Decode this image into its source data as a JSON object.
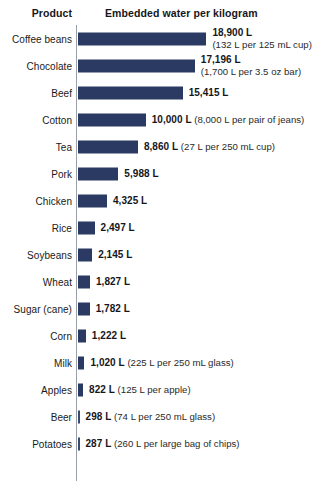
{
  "header": {
    "product_label": "Product",
    "value_label": "Embedded water per kilogram"
  },
  "colors": {
    "bar": "#2b3a63",
    "axis": "#9aa0a8",
    "background": "#ffffff",
    "text": "#16161a"
  },
  "chart_data": {
    "type": "bar",
    "title": "",
    "xlabel": "Embedded water per kilogram",
    "ylabel": "Product",
    "orientation": "horizontal",
    "unit": "L",
    "grid": false,
    "legend": null,
    "xlim": [
      0,
      18900
    ],
    "categories": [
      "Coffee beans",
      "Chocolate",
      "Beef",
      "Cotton",
      "Tea",
      "Pork",
      "Chicken",
      "Rice",
      "Soybeans",
      "Wheat",
      "Sugar (cane)",
      "Corn",
      "Milk",
      "Apples",
      "Beer",
      "Potatoes"
    ],
    "values": [
      18900,
      17196,
      15415,
      10000,
      8860,
      5988,
      4325,
      2497,
      2145,
      1827,
      1782,
      1222,
      1020,
      822,
      298,
      287
    ],
    "value_labels": [
      "18,900 L",
      "17,196 L",
      "15,415 L",
      "10,000 L",
      "8,860 L",
      "5,988 L",
      "4,325 L",
      "2,497 L",
      "2,145 L",
      "1,827 L",
      "1,782 L",
      "1,222 L",
      "1,020 L",
      "822 L",
      "298 L",
      "287 L"
    ],
    "annotations": [
      "(132 L per 125 mL cup)",
      "(1,700 L per 3.5 oz bar)",
      "",
      "(8,000 L per pair of jeans)",
      "(27 L per 250 mL cup)",
      "",
      "",
      "",
      "",
      "",
      "",
      "",
      "(225 L per 250 mL glass)",
      "(125 L per apple)",
      "(74 L per 250 mL glass)",
      "(260 L per large bag of chips)"
    ]
  },
  "rows": [
    {
      "label": "Coffee beans",
      "value": 18900,
      "value_label": "18,900 L",
      "note": "(132 L per 125 mL cup)",
      "stacked": true
    },
    {
      "label": "Chocolate",
      "value": 17196,
      "value_label": "17,196 L",
      "note": "(1,700 L per 3.5 oz bar)",
      "stacked": true
    },
    {
      "label": "Beef",
      "value": 15415,
      "value_label": "15,415 L",
      "note": "",
      "stacked": false
    },
    {
      "label": "Cotton",
      "value": 10000,
      "value_label": "10,000 L",
      "note": "(8,000 L per pair of jeans)",
      "stacked": false
    },
    {
      "label": "Tea",
      "value": 8860,
      "value_label": "8,860 L",
      "note": "(27 L per 250 mL cup)",
      "stacked": false
    },
    {
      "label": "Pork",
      "value": 5988,
      "value_label": "5,988 L",
      "note": "",
      "stacked": false
    },
    {
      "label": "Chicken",
      "value": 4325,
      "value_label": "4,325 L",
      "note": "",
      "stacked": false
    },
    {
      "label": "Rice",
      "value": 2497,
      "value_label": "2,497 L",
      "note": "",
      "stacked": false
    },
    {
      "label": "Soybeans",
      "value": 2145,
      "value_label": "2,145 L",
      "note": "",
      "stacked": false
    },
    {
      "label": "Wheat",
      "value": 1827,
      "value_label": "1,827 L",
      "note": "",
      "stacked": false
    },
    {
      "label": "Sugar (cane)",
      "value": 1782,
      "value_label": "1,782 L",
      "note": "",
      "stacked": false
    },
    {
      "label": "Corn",
      "value": 1222,
      "value_label": "1,222 L",
      "note": "",
      "stacked": false
    },
    {
      "label": "Milk",
      "value": 1020,
      "value_label": "1,020 L",
      "note": "(225 L per 250 mL glass)",
      "stacked": false
    },
    {
      "label": "Apples",
      "value": 822,
      "value_label": "822 L",
      "note": "(125 L per apple)",
      "stacked": false
    },
    {
      "label": "Beer",
      "value": 298,
      "value_label": "298 L",
      "note": "(74 L per 250 mL glass)",
      "stacked": false
    },
    {
      "label": "Potatoes",
      "value": 287,
      "value_label": "287 L",
      "note": "(260 L per large bag of chips)",
      "stacked": false
    }
  ],
  "scale": {
    "px_per_litre": 0.00682,
    "bar_origin_x": 77.5,
    "min_bar_px": 2
  }
}
